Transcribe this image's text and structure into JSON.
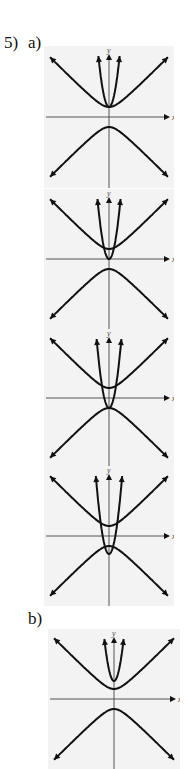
{
  "problem": {
    "number_label": "5)",
    "part_a_label": "a)",
    "part_b_label": "b)"
  },
  "axes": {
    "x_label": "x",
    "y_label": "y"
  },
  "chart_data": [
    {
      "type": "line",
      "title": "5a graph 1",
      "description": "Hyperbola y^2 - x^2 = 1 (both branches, vertices at y=±1) with parabola tangent at vertex (0,1)",
      "series": [
        {
          "name": "hyperbola",
          "vertices": [
            [
              0,
              1
            ],
            [
              0,
              -1
            ]
          ],
          "asymptotes": "y=±x"
        },
        {
          "name": "parabola",
          "vertex": [
            0,
            1
          ],
          "opens": "up"
        }
      ],
      "grid": false
    },
    {
      "type": "line",
      "title": "5a graph 2",
      "description": "Same hyperbola; parabola vertex at origin (0,0) intersecting upper branch twice",
      "series": [
        {
          "name": "hyperbola",
          "vertices": [
            [
              0,
              1
            ],
            [
              0,
              -1
            ]
          ],
          "asymptotes": "y=±x"
        },
        {
          "name": "parabola",
          "vertex": [
            0,
            0
          ],
          "opens": "up"
        }
      ],
      "grid": false
    },
    {
      "type": "line",
      "title": "5a graph 3",
      "description": "Same hyperbola; parabola vertex at (0,-1) touching lower branch vertex",
      "series": [
        {
          "name": "hyperbola",
          "vertices": [
            [
              0,
              1
            ],
            [
              0,
              -1
            ]
          ],
          "asymptotes": "y=±x"
        },
        {
          "name": "parabola",
          "vertex": [
            0,
            -1
          ],
          "opens": "up"
        }
      ],
      "grid": false
    },
    {
      "type": "line",
      "title": "5a graph 4",
      "description": "Same hyperbola; parabola vertex below (0,-1.8) crossing lower branch and upper branch",
      "series": [
        {
          "name": "hyperbola",
          "vertices": [
            [
              0,
              1
            ],
            [
              0,
              -1
            ]
          ],
          "asymptotes": "y=±x"
        },
        {
          "name": "parabola",
          "vertex": [
            0,
            -1.8
          ],
          "opens": "up"
        }
      ],
      "grid": false
    },
    {
      "type": "line",
      "title": "5b graph",
      "description": "Same hyperbola; parabola vertex above (0,1.8), no intersection",
      "series": [
        {
          "name": "hyperbola",
          "vertices": [
            [
              0,
              1
            ],
            [
              0,
              -1
            ]
          ],
          "asymptotes": "y=±x"
        },
        {
          "name": "parabola",
          "vertex": [
            0,
            1.8
          ],
          "opens": "up"
        }
      ],
      "grid": false
    }
  ]
}
